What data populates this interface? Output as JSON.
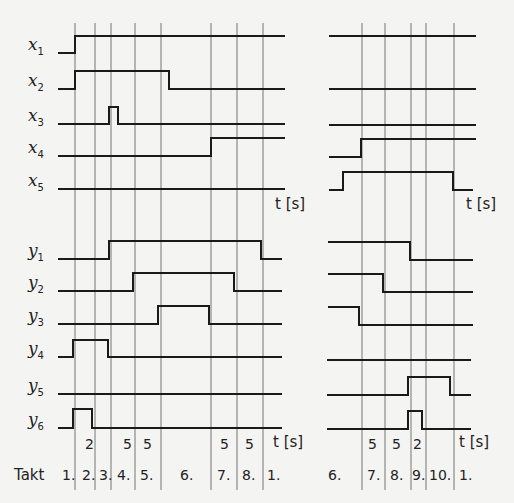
{
  "diagram": {
    "time_unit_label": "t [s]",
    "takt_label": "Takt",
    "left_panel": {
      "grid_x": [
        75,
        95,
        111,
        135,
        161,
        211,
        237,
        263
      ],
      "x_range": [
        58,
        285
      ],
      "durations": [
        {
          "x": 85,
          "text": "2"
        },
        {
          "x": 123,
          "text": "5"
        },
        {
          "x": 143,
          "text": "5"
        },
        {
          "x": 220,
          "text": "5"
        },
        {
          "x": 245,
          "text": "5"
        }
      ],
      "takts": [
        {
          "x": 62,
          "text": "1."
        },
        {
          "x": 82,
          "text": "2."
        },
        {
          "x": 99,
          "text": "3."
        },
        {
          "x": 117,
          "text": "4."
        },
        {
          "x": 140,
          "text": "5."
        },
        {
          "x": 180,
          "text": "6."
        },
        {
          "x": 217,
          "text": "7."
        },
        {
          "x": 242,
          "text": "8."
        },
        {
          "x": 267,
          "text": "1."
        }
      ]
    },
    "right_panel": {
      "grid_x": [
        362,
        385,
        411,
        426,
        454
      ],
      "x_range": [
        329,
        476
      ],
      "durations": [
        {
          "x": 368,
          "text": "5"
        },
        {
          "x": 392,
          "text": "5"
        },
        {
          "x": 413,
          "text": "2"
        }
      ],
      "takts": [
        {
          "x": 328,
          "text": "6."
        },
        {
          "x": 367,
          "text": "7."
        },
        {
          "x": 390,
          "text": "8."
        },
        {
          "x": 412,
          "text": "9."
        },
        {
          "x": 429,
          "text": "10."
        },
        {
          "x": 459,
          "text": "1."
        }
      ]
    },
    "signals": [
      {
        "name": "x",
        "sub": "1",
        "label_y": 53,
        "left": [
          [
            58,
            53
          ],
          [
            75,
            53
          ],
          [
            75,
            36
          ],
          [
            285,
            36
          ]
        ],
        "right": [
          [
            329,
            36
          ],
          [
            476,
            36
          ]
        ]
      },
      {
        "name": "x",
        "sub": "2",
        "label_y": 89,
        "left": [
          [
            58,
            89
          ],
          [
            75,
            89
          ],
          [
            75,
            71
          ],
          [
            169,
            71
          ],
          [
            169,
            89
          ],
          [
            285,
            89
          ]
        ],
        "right": [
          [
            329,
            89
          ],
          [
            476,
            89
          ]
        ]
      },
      {
        "name": "x",
        "sub": "3",
        "label_y": 124,
        "left": [
          [
            58,
            124
          ],
          [
            109,
            124
          ],
          [
            109,
            107
          ],
          [
            118,
            107
          ],
          [
            118,
            124
          ],
          [
            285,
            124
          ]
        ],
        "right": [
          [
            329,
            125
          ],
          [
            476,
            125
          ]
        ]
      },
      {
        "name": "x",
        "sub": "4",
        "label_y": 156,
        "left": [
          [
            58,
            156
          ],
          [
            211,
            156
          ],
          [
            211,
            138
          ],
          [
            285,
            138
          ]
        ],
        "right": [
          [
            329,
            157
          ],
          [
            361,
            157
          ],
          [
            361,
            139
          ],
          [
            476,
            139
          ]
        ]
      },
      {
        "name": "x",
        "sub": "5",
        "label_y": 189,
        "left": [
          [
            58,
            189
          ],
          [
            285,
            189
          ]
        ],
        "right": [
          [
            329,
            190
          ],
          [
            343,
            190
          ],
          [
            343,
            172
          ],
          [
            453,
            172
          ],
          [
            453,
            190
          ],
          [
            473,
            190
          ]
        ]
      },
      {
        "name": "y",
        "sub": "1",
        "label_y": 259,
        "left": [
          [
            58,
            259
          ],
          [
            109,
            259
          ],
          [
            109,
            241
          ],
          [
            261,
            241
          ],
          [
            261,
            259
          ],
          [
            282,
            259
          ]
        ],
        "right": [
          [
            328,
            242
          ],
          [
            410,
            242
          ],
          [
            410,
            260
          ],
          [
            473,
            260
          ]
        ]
      },
      {
        "name": "y",
        "sub": "2",
        "label_y": 291,
        "left": [
          [
            58,
            291
          ],
          [
            133,
            291
          ],
          [
            133,
            273
          ],
          [
            234,
            273
          ],
          [
            234,
            291
          ],
          [
            282,
            291
          ]
        ],
        "right": [
          [
            328,
            274
          ],
          [
            383,
            274
          ],
          [
            383,
            292
          ],
          [
            473,
            292
          ]
        ]
      },
      {
        "name": "y",
        "sub": "3",
        "label_y": 324,
        "left": [
          [
            58,
            324
          ],
          [
            158,
            324
          ],
          [
            158,
            306
          ],
          [
            209,
            306
          ],
          [
            209,
            324
          ],
          [
            282,
            324
          ]
        ],
        "right": [
          [
            328,
            307
          ],
          [
            359,
            307
          ],
          [
            359,
            325
          ],
          [
            473,
            325
          ]
        ]
      },
      {
        "name": "y",
        "sub": "4",
        "label_y": 357,
        "left": [
          [
            58,
            357
          ],
          [
            73,
            357
          ],
          [
            73,
            340
          ],
          [
            108,
            340
          ],
          [
            108,
            357
          ],
          [
            282,
            357
          ]
        ],
        "right": [
          [
            327,
            360
          ],
          [
            471,
            360
          ]
        ]
      },
      {
        "name": "y",
        "sub": "5",
        "label_y": 394,
        "left": [
          [
            58,
            394
          ],
          [
            282,
            394
          ]
        ],
        "right": [
          [
            327,
            395
          ],
          [
            408,
            395
          ],
          [
            408,
            377
          ],
          [
            450,
            377
          ],
          [
            450,
            395
          ],
          [
            471,
            395
          ]
        ]
      },
      {
        "name": "y",
        "sub": "6",
        "label_y": 428,
        "left": [
          [
            58,
            428
          ],
          [
            73,
            428
          ],
          [
            73,
            409
          ],
          [
            92,
            409
          ],
          [
            92,
            428
          ],
          [
            282,
            428
          ]
        ],
        "right": [
          [
            327,
            429
          ],
          [
            408,
            429
          ],
          [
            408,
            411
          ],
          [
            422,
            411
          ],
          [
            422,
            429
          ],
          [
            471,
            429
          ]
        ]
      }
    ],
    "t_labels": [
      {
        "x": 275,
        "y": 209
      },
      {
        "x": 466,
        "y": 209
      },
      {
        "x": 273,
        "y": 447
      },
      {
        "x": 459,
        "y": 447
      }
    ]
  }
}
